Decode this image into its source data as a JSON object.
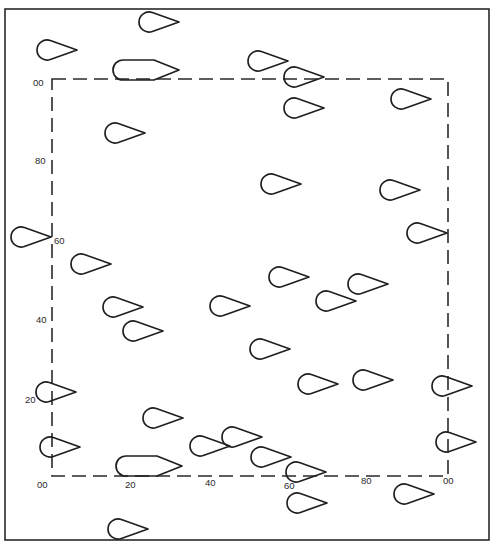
{
  "figure": {
    "colors": {
      "background": "#ffffff",
      "stroke": "#1f1f1f"
    },
    "outer_frame": {
      "x": 5,
      "y": 9,
      "width": 484,
      "height": 531
    },
    "measurement_area": {
      "x": 52,
      "y": 79,
      "width": 396,
      "height": 397
    },
    "axes": {
      "y_labels": [
        {
          "text": "00",
          "x": 33,
          "y": 86
        },
        {
          "text": "80",
          "x": 35,
          "y": 164
        },
        {
          "text": "60",
          "x": 54,
          "y": 244
        },
        {
          "text": "40",
          "x": 36,
          "y": 323
        },
        {
          "text": "20",
          "x": 25,
          "y": 403
        },
        {
          "text": "00",
          "x": 37,
          "y": 488
        }
      ],
      "x_labels": [
        {
          "text": "20",
          "x": 125,
          "y": 488
        },
        {
          "text": "40",
          "x": 205,
          "y": 486
        },
        {
          "text": "60",
          "x": 284,
          "y": 489
        },
        {
          "text": "80",
          "x": 361,
          "y": 484
        },
        {
          "text": "00",
          "x": 443,
          "y": 484
        }
      ]
    },
    "fish_shape_types": {
      "teardrop": "rounded head left, pointed tail right",
      "elongated": "long rounded body tapering to a point on the right"
    },
    "fish": [
      {
        "x": 139,
        "y": 22,
        "w": 40,
        "type": "teardrop"
      },
      {
        "x": 37,
        "y": 50,
        "w": 40,
        "type": "teardrop"
      },
      {
        "x": 113,
        "y": 70,
        "w": 66,
        "type": "elongated"
      },
      {
        "x": 248,
        "y": 61,
        "w": 40,
        "type": "teardrop"
      },
      {
        "x": 284,
        "y": 77,
        "w": 40,
        "type": "teardrop"
      },
      {
        "x": 391,
        "y": 99,
        "w": 40,
        "type": "teardrop"
      },
      {
        "x": 284,
        "y": 108,
        "w": 40,
        "type": "teardrop"
      },
      {
        "x": 105,
        "y": 133,
        "w": 40,
        "type": "teardrop"
      },
      {
        "x": 261,
        "y": 184,
        "w": 40,
        "type": "teardrop"
      },
      {
        "x": 380,
        "y": 190,
        "w": 40,
        "type": "teardrop"
      },
      {
        "x": 407,
        "y": 233,
        "w": 40,
        "type": "teardrop"
      },
      {
        "x": 11,
        "y": 237,
        "w": 40,
        "type": "teardrop"
      },
      {
        "x": 71,
        "y": 264,
        "w": 40,
        "type": "teardrop"
      },
      {
        "x": 269,
        "y": 277,
        "w": 40,
        "type": "teardrop"
      },
      {
        "x": 348,
        "y": 284,
        "w": 40,
        "type": "teardrop"
      },
      {
        "x": 316,
        "y": 301,
        "w": 40,
        "type": "teardrop"
      },
      {
        "x": 103,
        "y": 307,
        "w": 40,
        "type": "teardrop"
      },
      {
        "x": 210,
        "y": 306,
        "w": 40,
        "type": "teardrop"
      },
      {
        "x": 123,
        "y": 331,
        "w": 40,
        "type": "teardrop"
      },
      {
        "x": 250,
        "y": 349,
        "w": 40,
        "type": "teardrop"
      },
      {
        "x": 298,
        "y": 384,
        "w": 40,
        "type": "teardrop"
      },
      {
        "x": 353,
        "y": 380,
        "w": 40,
        "type": "teardrop"
      },
      {
        "x": 432,
        "y": 386,
        "w": 40,
        "type": "teardrop"
      },
      {
        "x": 36,
        "y": 392,
        "w": 40,
        "type": "teardrop"
      },
      {
        "x": 143,
        "y": 418,
        "w": 40,
        "type": "teardrop"
      },
      {
        "x": 190,
        "y": 446,
        "w": 40,
        "type": "teardrop"
      },
      {
        "x": 222,
        "y": 437,
        "w": 40,
        "type": "teardrop"
      },
      {
        "x": 40,
        "y": 447,
        "w": 40,
        "type": "teardrop"
      },
      {
        "x": 436,
        "y": 442,
        "w": 40,
        "type": "teardrop"
      },
      {
        "x": 251,
        "y": 457,
        "w": 40,
        "type": "teardrop"
      },
      {
        "x": 116,
        "y": 466,
        "w": 66,
        "type": "elongated"
      },
      {
        "x": 286,
        "y": 472,
        "w": 40,
        "type": "teardrop"
      },
      {
        "x": 394,
        "y": 494,
        "w": 40,
        "type": "teardrop"
      },
      {
        "x": 287,
        "y": 503,
        "w": 40,
        "type": "teardrop"
      },
      {
        "x": 108,
        "y": 529,
        "w": 40,
        "type": "teardrop"
      }
    ]
  }
}
